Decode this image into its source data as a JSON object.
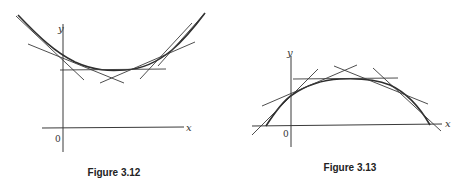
{
  "figures": [
    {
      "id": "fig-3-12",
      "caption": "Figure 3.12",
      "description": "Convex curve lying above all of its tangent lines",
      "axes": {
        "x_label": "x",
        "y_label": "y",
        "origin_label": "0"
      }
    },
    {
      "id": "fig-3-13",
      "caption": "Figure 3.13",
      "description": "Concave curve lying below all of its tangent lines",
      "axes": {
        "x_label": "x",
        "y_label": "y",
        "origin_label": "0"
      }
    }
  ]
}
